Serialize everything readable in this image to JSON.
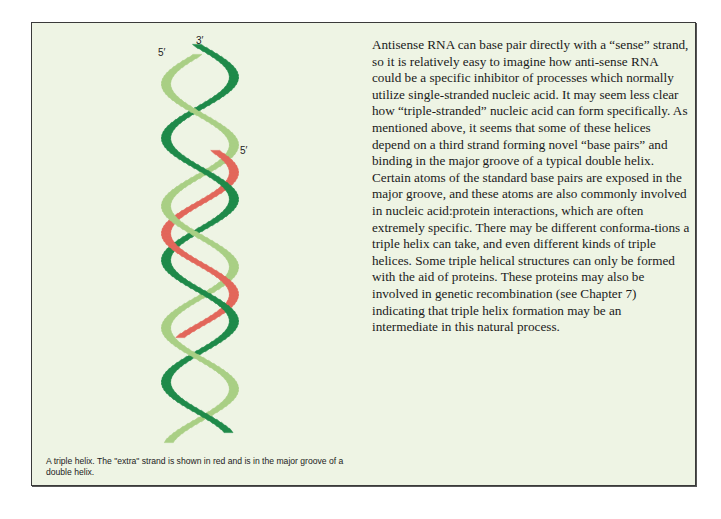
{
  "figure": {
    "labels": {
      "strand1_top": "3′",
      "strand2_top": "5′",
      "strand3_top": "5′"
    },
    "strands": [
      {
        "name": "dark-green-strand",
        "color": "#1f8a4a"
      },
      {
        "name": "light-green-strand",
        "color": "#a9cf85"
      },
      {
        "name": "red-extra-strand",
        "color": "#e2675b"
      }
    ],
    "caption": "A triple helix.  The \"extra\" strand is shown in red and is in the major groove of a double helix."
  },
  "body": {
    "paragraph": "Antisense RNA can base pair directly with a “sense” strand, so it is relatively easy to imagine how anti-sense RNA could be a specific inhibitor of processes which normally utilize single-stranded nucleic acid. It may seem less clear how “triple-stranded” nucleic acid can form specifically. As mentioned above, it seems that some of these helices depend on a third strand forming novel “base pairs” and binding in the major groove of a typical double helix. Certain atoms of the standard base pairs are exposed in the major groove, and these atoms are also commonly involved in nucleic acid:protein interactions, which are often extremely specific. There may be different conforma-tions a triple helix can take, and even different kinds of triple helices. Some triple helical structures can only be formed with the aid of proteins. These proteins may also be involved in genetic recombination (see Chapter 7) indicating that triple helix formation may be an intermediate in this natural process."
  }
}
